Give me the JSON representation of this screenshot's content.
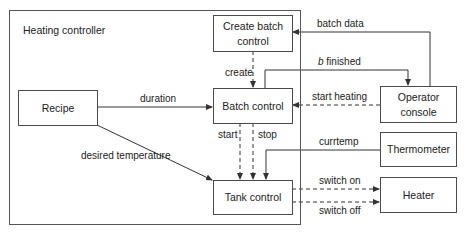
{
  "diagram": {
    "container": {
      "label": "Heating controller"
    },
    "nodes": {
      "create_batch": {
        "line1": "Create batch",
        "line2": "control"
      },
      "recipe": {
        "label": "Recipe"
      },
      "batch_control": {
        "label": "Batch control"
      },
      "tank_control": {
        "label": "Tank control"
      },
      "operator_console": {
        "line1": "Operator",
        "line2": "console"
      },
      "thermometer": {
        "label": "Thermometer"
      },
      "heater": {
        "label": "Heater"
      }
    },
    "edges": {
      "batch_data": "batch data",
      "create": "create",
      "b_finished_var": "b",
      "b_finished_rest": " finished",
      "duration": "duration",
      "start_heating": "start heating",
      "start": "start",
      "stop": "stop",
      "desired_temperature": "desired temperature",
      "currtemp": "currtemp",
      "switch_on": "switch on",
      "switch_off": "switch off"
    }
  }
}
